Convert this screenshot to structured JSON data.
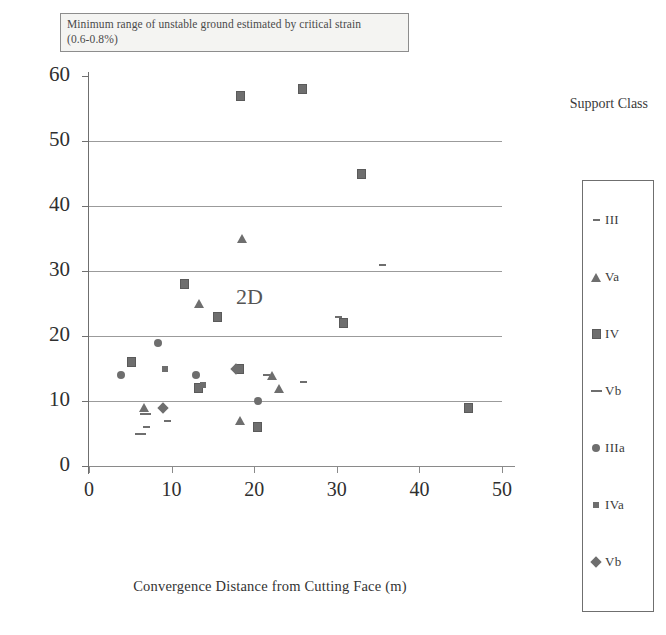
{
  "figure": {
    "title_lines": [
      "Minimum range of unstable ground estimated by critical strain",
      "(0.6-0.8%)"
    ],
    "annotation": "2D",
    "legend_title": "Support Class",
    "marker_color": "#6e6e6e",
    "grid_color": "#8a8a8a"
  },
  "chart_data": {
    "type": "scatter",
    "title": "Minimum range of unstable ground estimated by critical strain (0.6-0.8%)",
    "xlabel": "Convergence Distance from Cutting Face (m)",
    "ylabel": "Settlement of Crown (mm)",
    "xlim": [
      0,
      50
    ],
    "ylim": [
      0,
      60
    ],
    "xticks": [
      0,
      10,
      20,
      30,
      40,
      50
    ],
    "yticks": [
      0,
      10,
      20,
      30,
      40,
      50,
      60
    ],
    "grid": "horizontal",
    "legend_position": "right-outside",
    "annotations": [
      {
        "text": "2D",
        "x": 19.5,
        "y": 25.5
      }
    ],
    "series": [
      {
        "name": "III",
        "marker": "dash-small",
        "points": [
          {
            "x": 7.0,
            "y": 6.0
          },
          {
            "x": 9.5,
            "y": 7.0
          },
          {
            "x": 21.5,
            "y": 14.0
          },
          {
            "x": 26.0,
            "y": 13.0
          },
          {
            "x": 30.2,
            "y": 23.0
          },
          {
            "x": 35.5,
            "y": 31.0
          }
        ]
      },
      {
        "name": "Va",
        "marker": "triangle",
        "points": [
          {
            "x": 6.6,
            "y": 9.0
          },
          {
            "x": 13.3,
            "y": 25.0
          },
          {
            "x": 18.5,
            "y": 35.0
          },
          {
            "x": 18.3,
            "y": 7.0
          },
          {
            "x": 22.2,
            "y": 14.0
          },
          {
            "x": 23.0,
            "y": 12.0
          }
        ]
      },
      {
        "name": "IV",
        "marker": "square",
        "points": [
          {
            "x": 5.2,
            "y": 16.0
          },
          {
            "x": 11.6,
            "y": 28.0
          },
          {
            "x": 13.3,
            "y": 12.0
          },
          {
            "x": 15.5,
            "y": 23.0
          },
          {
            "x": 18.2,
            "y": 15.0
          },
          {
            "x": 20.4,
            "y": 6.0
          },
          {
            "x": 18.3,
            "y": 57.0
          },
          {
            "x": 25.8,
            "y": 58.0
          },
          {
            "x": 33.0,
            "y": 45.0
          },
          {
            "x": 30.8,
            "y": 22.0
          },
          {
            "x": 46.0,
            "y": 9.0
          }
        ]
      },
      {
        "name": "Vb",
        "marker": "dash-long",
        "points": [
          {
            "x": 6.8,
            "y": 8.0
          },
          {
            "x": 6.2,
            "y": 5.0
          }
        ]
      },
      {
        "name": "IIIa",
        "marker": "circle",
        "points": [
          {
            "x": 3.9,
            "y": 14.0
          },
          {
            "x": 8.3,
            "y": 19.0
          },
          {
            "x": 13.0,
            "y": 14.0
          },
          {
            "x": 20.4,
            "y": 10.0
          }
        ]
      },
      {
        "name": "IVa",
        "marker": "square-small",
        "points": [
          {
            "x": 9.2,
            "y": 15.0
          },
          {
            "x": 13.8,
            "y": 12.5
          }
        ]
      },
      {
        "name": "Vb",
        "marker": "diamond",
        "points": [
          {
            "x": 8.9,
            "y": 9.0
          },
          {
            "x": 17.8,
            "y": 15.0
          }
        ]
      }
    ]
  },
  "legend": {
    "items": [
      {
        "label": "III",
        "marker": "dash-small"
      },
      {
        "label": "Va",
        "marker": "triangle"
      },
      {
        "label": "IV",
        "marker": "square"
      },
      {
        "label": "Vb",
        "marker": "dash-long"
      },
      {
        "label": "IIIa",
        "marker": "circle"
      },
      {
        "label": "IVa",
        "marker": "square-small"
      },
      {
        "label": "Vb",
        "marker": "diamond"
      }
    ]
  }
}
